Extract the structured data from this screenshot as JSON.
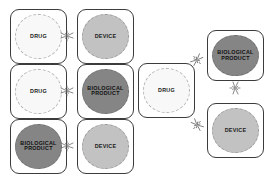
{
  "diagram": {
    "type": "combination-product-constituent-diagram",
    "background_color": "#ffffff",
    "entity_colors": {
      "drug": "#f8f8f8",
      "device": "#c2c2c2",
      "biological_product": "#858585",
      "outline": "#3c3c3c"
    },
    "groups": [
      {
        "id": "two-part-combinations",
        "pairs": [
          {
            "id": "drug-device",
            "left": {
              "label": "DRUG",
              "type": "drug"
            },
            "right": {
              "label": "DEVICE",
              "type": "device"
            }
          },
          {
            "id": "drug-bio",
            "left": {
              "label": "DRUG",
              "type": "drug"
            },
            "right": {
              "label": "BIOLOGICAL\nPRODUCT",
              "type": "biological_product"
            }
          },
          {
            "id": "bio-device",
            "left": {
              "label": "BIOLOGICAL\nPRODUCT",
              "type": "biological_product"
            },
            "right": {
              "label": "DEVICE",
              "type": "device"
            }
          }
        ]
      },
      {
        "id": "three-part-combination",
        "hub": {
          "label": "DRUG",
          "type": "drug"
        },
        "spokes": [
          {
            "label": "BIOLOGICAL\nPRODUCT",
            "type": "biological_product"
          },
          {
            "label": "DEVICE",
            "type": "device"
          }
        ]
      }
    ],
    "connectors": [
      {
        "id": "conn-drug-device",
        "orientation": "horizontal"
      },
      {
        "id": "conn-drug-bio",
        "orientation": "horizontal"
      },
      {
        "id": "conn-bio-device",
        "orientation": "horizontal"
      },
      {
        "id": "conn-hub-bio",
        "orientation": "diagonal-up"
      },
      {
        "id": "conn-hub-device",
        "orientation": "diagonal-down"
      },
      {
        "id": "conn-bio-device-2",
        "orientation": "vertical"
      }
    ]
  }
}
